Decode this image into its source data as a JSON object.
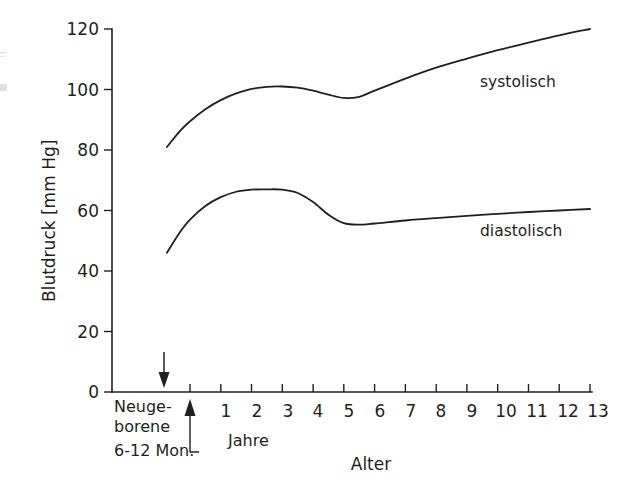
{
  "chart_data": {
    "type": "line",
    "title": "",
    "xlabel": "Alter",
    "ylabel": "Blutdruck [mm Hg]",
    "ylim": [
      0,
      120
    ],
    "ytick_values": [
      0,
      20,
      40,
      60,
      80,
      100,
      120
    ],
    "ytick_labels": [
      "0",
      "20",
      "40",
      "60",
      "80",
      "100",
      "120"
    ],
    "xtick_labels": [
      "1",
      "2",
      "3",
      "4",
      "5",
      "6",
      "7",
      "8",
      "9",
      "10",
      "11",
      "12",
      "13"
    ],
    "x_unit_label": "Jahre",
    "grid": false,
    "legend_position": "inline-right",
    "categories_before_axis": [
      "Neuge-",
      "borene",
      "6-12 Mon."
    ],
    "annotations": [
      {
        "name": "newborn-arrow",
        "direction": "down",
        "label": "Neugeborene"
      },
      {
        "name": "six-twelve-month-arrow",
        "direction": "up",
        "label": "6-12 Mon."
      }
    ],
    "series": [
      {
        "name": "systolisch",
        "label": "systolisch",
        "color": "#231f20",
        "x": [
          -0.75,
          -0.35,
          0.0,
          0.5,
          1.0,
          1.5,
          2.0,
          2.5,
          3.0,
          3.5,
          4.0,
          4.5,
          5.0,
          5.5,
          6.0,
          7.0,
          8.0,
          9.0,
          10.0,
          11.0,
          12.0,
          13.0
        ],
        "y": [
          81,
          86,
          89.5,
          93.5,
          96.5,
          98.7,
          100.2,
          100.9,
          101.0,
          100.6,
          99.6,
          98.3,
          97.2,
          97.6,
          99.6,
          103.6,
          107.2,
          110.2,
          113.0,
          115.5,
          117.9,
          120.0
        ]
      },
      {
        "name": "diastolisch",
        "label": "diastolisch",
        "color": "#231f20",
        "x": [
          -0.75,
          -0.35,
          0.0,
          0.5,
          1.0,
          1.5,
          2.0,
          2.5,
          3.0,
          3.5,
          4.0,
          4.5,
          5.0,
          5.5,
          6.0,
          7.0,
          8.0,
          9.0,
          10.0,
          11.0,
          12.0,
          13.0
        ],
        "y": [
          46,
          52.5,
          57.0,
          61.5,
          64.4,
          66.2,
          66.9,
          67.0,
          66.9,
          65.8,
          62.8,
          58.6,
          55.8,
          55.3,
          55.7,
          56.7,
          57.5,
          58.2,
          58.9,
          59.5,
          60.0,
          60.5
        ]
      }
    ]
  },
  "axis": {
    "y_title": "Blutdruck [mm Hg]",
    "x_title": "Alter",
    "x_unit": "Jahre",
    "y_ticks": [
      "120",
      "100",
      "80",
      "60",
      "40",
      "20",
      "0"
    ],
    "x_ticks": [
      "1",
      "2",
      "3",
      "4",
      "5",
      "6",
      "7",
      "8",
      "9",
      "10",
      "11",
      "12",
      "13"
    ]
  },
  "categories": {
    "newborn_line1": "Neuge-",
    "newborn_line2": "borene",
    "months": "6-12 Mon."
  },
  "series_labels": {
    "systolic": "systolisch",
    "diastolic": "diastolisch"
  }
}
